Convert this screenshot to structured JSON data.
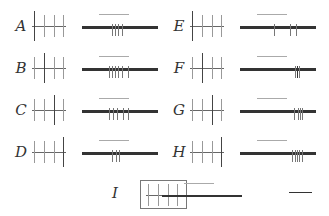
{
  "figure": {
    "panels": [
      {
        "label": "A",
        "big_tick": 0,
        "spikes": [
          30,
          33,
          36,
          40,
          45
        ]
      },
      {
        "label": "B",
        "big_tick": 1,
        "spikes": [
          28,
          31,
          34,
          37,
          40,
          44,
          50
        ]
      },
      {
        "label": "C",
        "big_tick": 2,
        "spikes": [
          28,
          32,
          35,
          40,
          46,
          52
        ]
      },
      {
        "label": "D",
        "big_tick": 3,
        "spikes": [
          30,
          34,
          37,
          40
        ]
      },
      {
        "label": "E",
        "big_tick": 0,
        "spikes": [
          34,
          50,
          58
        ]
      },
      {
        "label": "F",
        "big_tick": 1,
        "spikes": [
          58,
          60,
          62
        ]
      },
      {
        "label": "G",
        "big_tick": 2,
        "spikes": [
          55,
          59,
          61,
          63
        ]
      },
      {
        "label": "H",
        "big_tick": 3,
        "spikes": [
          52,
          55,
          57,
          59,
          61
        ]
      },
      {
        "label": "I",
        "big_tick": -1,
        "spikes": []
      }
    ],
    "scale_bar": "scale-bar"
  }
}
